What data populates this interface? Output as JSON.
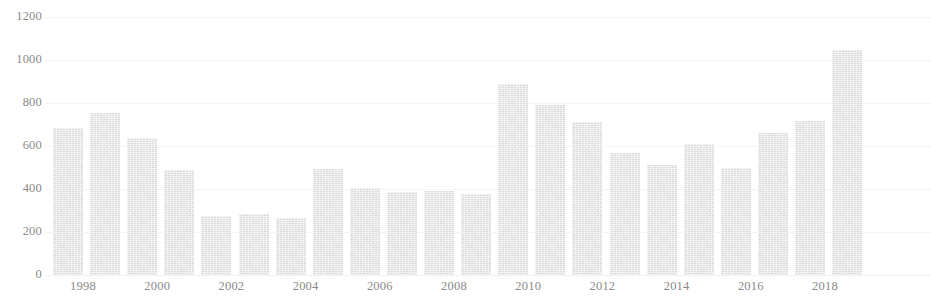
{
  "chart_data": {
    "type": "bar",
    "title": "",
    "xlabel": "",
    "ylabel": "",
    "ylim": [
      0,
      1200
    ],
    "grid": true,
    "legend": "none",
    "y_ticks": [
      0,
      200,
      400,
      600,
      800,
      1000,
      1200
    ],
    "y_tick_labels": [
      "0",
      "200",
      "400",
      "600",
      "800",
      "1000",
      "1200"
    ],
    "x_tick_labels": [
      "1998",
      "2000",
      "2002",
      "2004",
      "2006",
      "2008",
      "2010",
      "2012",
      "2014",
      "2016",
      "2018"
    ],
    "categories": [
      "1998",
      "1999",
      "2000",
      "2001",
      "2002",
      "2003",
      "2004",
      "2005",
      "2006",
      "2007",
      "2008",
      "2009",
      "2010",
      "2011",
      "2012",
      "2013",
      "2014",
      "2015",
      "2016",
      "2017",
      "2018",
      "2019"
    ],
    "values": [
      685,
      755,
      635,
      487,
      275,
      285,
      265,
      492,
      403,
      385,
      393,
      377,
      890,
      790,
      712,
      568,
      512,
      610,
      500,
      660,
      718,
      1045
    ],
    "bar_color": "#e3e3e3",
    "axis_text_color": "#8a8a8a",
    "gridline_color": "#f4f4f4",
    "background_color": "#ffffff"
  }
}
